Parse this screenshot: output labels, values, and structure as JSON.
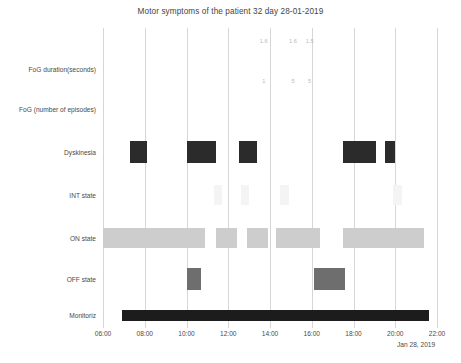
{
  "chart_data": {
    "type": "bar",
    "title": "Motor symptoms of the patient 32 day 28-01-2019",
    "xlabel": "Jan 28, 2019",
    "ylabel": "",
    "orientation": "horizontal-timeline",
    "grid": true,
    "legend": "none",
    "x_axis": {
      "type": "time",
      "date": "Jan 28, 2019",
      "min": "05:00",
      "max": "22:00",
      "tick_labels": [
        "06:00",
        "08:00",
        "10:00",
        "12:00",
        "14:00",
        "16:00",
        "18:00",
        "20:00",
        "22:00"
      ],
      "tick_hours": [
        6,
        8,
        10,
        12,
        14,
        16,
        18,
        20,
        22
      ]
    },
    "categories": [
      "FoG duration(seconds)",
      "FoG (number of episodes)",
      "Dyskinesia",
      "INT state",
      "ON state",
      "OFF state",
      "Monitoriz"
    ],
    "series": [
      {
        "name": "FoG duration(seconds)",
        "type": "text-markers",
        "color": "#b9b9b9",
        "points": [
          {
            "label": "1.6",
            "hour": 13.7
          },
          {
            "label": "1.6",
            "hour": 15.1
          },
          {
            "label": "1.5",
            "hour": 15.9
          }
        ]
      },
      {
        "name": "FoG (number of episodes)",
        "type": "text-markers",
        "color": "#b9b9b9",
        "points": [
          {
            "label": "1",
            "hour": 13.7
          },
          {
            "label": "5",
            "hour": 15.1
          },
          {
            "label": "5",
            "hour": 15.9
          }
        ]
      },
      {
        "name": "Dyskinesia",
        "type": "intervals",
        "color": "#2b2b2b",
        "intervals": [
          {
            "start_hour": 7.3,
            "end_hour": 8.1
          },
          {
            "start_hour": 10.0,
            "end_hour": 11.4
          },
          {
            "start_hour": 12.5,
            "end_hour": 13.4
          },
          {
            "start_hour": 17.5,
            "end_hour": 19.1
          },
          {
            "start_hour": 19.5,
            "end_hour": 20.0
          }
        ]
      },
      {
        "name": "INT state",
        "type": "intervals",
        "color": "#f4f4f4",
        "intervals": [
          {
            "start_hour": 11.3,
            "end_hour": 11.7
          },
          {
            "start_hour": 12.6,
            "end_hour": 13.0
          },
          {
            "start_hour": 14.5,
            "end_hour": 14.9
          },
          {
            "start_hour": 19.9,
            "end_hour": 20.3
          }
        ]
      },
      {
        "name": "ON state",
        "type": "intervals",
        "color": "#cdcdcd",
        "intervals": [
          {
            "start_hour": 6.0,
            "end_hour": 10.9
          },
          {
            "start_hour": 11.4,
            "end_hour": 12.4
          },
          {
            "start_hour": 12.9,
            "end_hour": 13.9
          },
          {
            "start_hour": 14.3,
            "end_hour": 16.4
          },
          {
            "start_hour": 17.5,
            "end_hour": 21.4
          }
        ]
      },
      {
        "name": "OFF state",
        "type": "intervals",
        "color": "#6e6e6e",
        "intervals": [
          {
            "start_hour": 10.0,
            "end_hour": 10.7
          },
          {
            "start_hour": 16.1,
            "end_hour": 17.6
          }
        ]
      },
      {
        "name": "Monitoriz",
        "type": "intervals",
        "color": "#1c1c1c",
        "intervals": [
          {
            "start_hour": 6.9,
            "end_hour": 21.6
          }
        ]
      }
    ]
  }
}
